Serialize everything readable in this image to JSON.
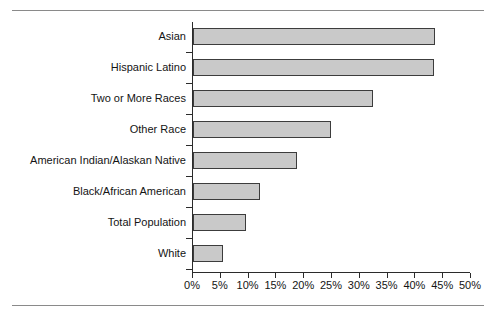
{
  "chart_data": {
    "type": "bar",
    "orientation": "horizontal",
    "title": "",
    "xlabel": "",
    "ylabel": "",
    "categories": [
      "Asian",
      "Hispanic Latino",
      "Two or More Races",
      "Other Race",
      "American Indian/Alaskan Native",
      "Black/African American",
      "Total Population",
      "White"
    ],
    "values": [
      43.5,
      43.3,
      32.4,
      24.8,
      18.7,
      12.1,
      9.5,
      5.4
    ],
    "value_unit": "%",
    "xlim": [
      0,
      50
    ],
    "xticks": [
      0,
      5,
      10,
      15,
      20,
      25,
      30,
      35,
      40,
      45,
      50
    ],
    "xtick_labels": [
      "0%",
      "5%",
      "10%",
      "15%",
      "20%",
      "25%",
      "30%",
      "35%",
      "40%",
      "45%",
      "50%"
    ],
    "grid": false,
    "legend": null,
    "bar_fill_color": "#c9c9c9",
    "bar_border_color": "#3c3c3c",
    "axis_color": "#2b2b2b",
    "background_color": "#ffffff"
  },
  "frame": {
    "top_rule_color": "#8a8a8a",
    "bottom_rule_color": "#8a8a8a"
  }
}
